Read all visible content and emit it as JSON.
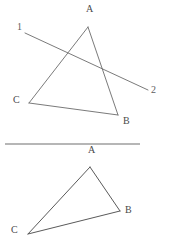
{
  "canvas": {
    "width": 170,
    "height": 249,
    "background": "#ffffff"
  },
  "style": {
    "stroke_color": "#6b6b6b",
    "label_color": "#4a4a4a",
    "divider_color": "#6e6e6e"
  },
  "figures": [
    {
      "id": "top-figure",
      "name": "triangle-with-transversal",
      "triangle": {
        "vertices": [
          {
            "label": "A",
            "x": 88,
            "y": 27,
            "label_x": 86,
            "label_y": 8
          },
          {
            "label": "B",
            "x": 118,
            "y": 115,
            "label_x": 123,
            "label_y": 115
          },
          {
            "label": "C",
            "x": 29,
            "y": 103,
            "label_x": 14,
            "label_y": 96
          }
        ]
      },
      "transversal": {
        "start": {
          "x": 25,
          "y": 33
        },
        "end": {
          "x": 148,
          "y": 90
        },
        "start_label": "1",
        "end_label": "2",
        "start_label_x": 17,
        "start_label_y": 23,
        "end_label_x": 152,
        "end_label_y": 85
      }
    },
    {
      "id": "bottom-figure",
      "name": "plain-triangle",
      "triangle": {
        "vertices": [
          {
            "label": "A",
            "x": 90,
            "y": 167,
            "label_x": 88,
            "label_y": 148
          },
          {
            "label": "B",
            "x": 120,
            "y": 211,
            "label_x": 125,
            "label_y": 208
          },
          {
            "label": "C",
            "x": 28,
            "y": 234,
            "label_x": 11,
            "label_y": 226
          }
        ]
      }
    }
  ],
  "divider": {
    "x1": 5,
    "y1": 144,
    "x2": 140,
    "y2": 144
  },
  "labels": {
    "top_a": "A",
    "top_b": "B",
    "top_c": "C",
    "ray_1": "1",
    "ray_2": "2",
    "bottom_a": "A",
    "bottom_b": "B",
    "bottom_c": "C"
  }
}
